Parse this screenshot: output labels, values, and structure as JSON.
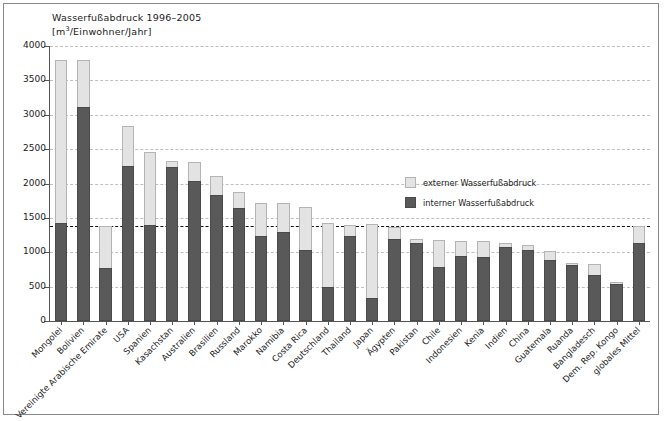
{
  "chart_data": {
    "type": "bar",
    "stacked": true,
    "title": "Wasserfußabdruck 1996–2005",
    "subtitle": "[m³/Einwohner/Jahr]",
    "xlabel": "",
    "ylabel": "",
    "ylim": [
      0,
      4000
    ],
    "ytick_step": 500,
    "ytick_labels": [
      "0",
      "500",
      "1000",
      "1500",
      "2000",
      "2500",
      "3000",
      "3500",
      "4000"
    ],
    "grid": true,
    "legend_position": "inside-upper-right",
    "reference_line": {
      "value": 1385,
      "style": "dashed",
      "color": "#111111"
    },
    "categories": [
      "Mongolei",
      "Bolivien",
      "Vereinigte Arabische Emirate",
      "USA",
      "Spanien",
      "Kasachstan",
      "Australien",
      "Brasilien",
      "Russland",
      "Marokko",
      "Namibia",
      "Costa Rica",
      "Deutschland",
      "Thailand",
      "Japan",
      "Ägypten",
      "Pakistan",
      "Chile",
      "Indonesien",
      "Kenia",
      "Indien",
      "China",
      "Guatemala",
      "Ruanda",
      "Bangladesch",
      "Dem. Rep. Kongo",
      "globales Mittel"
    ],
    "series": [
      {
        "name": "interner Wasserfußabdruck",
        "color": "#595959",
        "values": [
          1430,
          3120,
          770,
          2250,
          1400,
          2240,
          2040,
          1840,
          1640,
          1240,
          1300,
          1040,
          490,
          1240,
          340,
          1190,
          1130,
          790,
          940,
          930,
          1080,
          1040,
          890,
          820,
          670,
          540,
          1130
        ]
      },
      {
        "name": "externer Wasserfußabdruck",
        "color": "#e3e3e3",
        "values": [
          2370,
          680,
          610,
          590,
          1060,
          90,
          280,
          270,
          230,
          470,
          410,
          620,
          930,
          160,
          1070,
          180,
          60,
          390,
          230,
          230,
          60,
          60,
          130,
          30,
          160,
          30,
          255
        ]
      }
    ],
    "totals": [
      3800,
      3800,
      1380,
      2840,
      2460,
      2330,
      2320,
      2110,
      1870,
      1710,
      1710,
      1660,
      1420,
      1400,
      1410,
      1370,
      1190,
      1180,
      1170,
      1160,
      1140,
      1100,
      1020,
      850,
      830,
      570,
      1385
    ]
  },
  "legend": {
    "items": [
      {
        "label": "externer Wasserfußabdruck",
        "swatch": "ext"
      },
      {
        "label": "interner Wasserfußabdruck",
        "swatch": "int"
      }
    ]
  }
}
